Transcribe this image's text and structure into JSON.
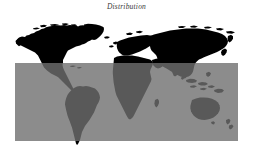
{
  "figure": {
    "title": "Distribution",
    "background_color": "#ffffff",
    "width": 253,
    "height": 157
  },
  "overlay": {
    "name": "distribution-highlight-rectangle",
    "color": "#6f6f6f",
    "opacity": 0.8,
    "x": 15,
    "y": 63,
    "width": 223,
    "height": 78
  },
  "map": {
    "name": "world-map-silhouette",
    "land_color": "#000000",
    "ocean_color": "#ffffff",
    "projection": "equirectangular",
    "regions": [
      "north-america",
      "greenland",
      "south-america",
      "europe",
      "africa",
      "asia",
      "australia",
      "new-zealand",
      "indonesia",
      "madagascar",
      "japan",
      "british-isles"
    ]
  },
  "chart_data": {
    "type": "heatmap",
    "title": "Distribution",
    "xlabel": "",
    "ylabel": "",
    "legend": "none",
    "grid": false,
    "categories": [
      "north-america",
      "greenland",
      "south-america",
      "europe",
      "africa",
      "asia",
      "australia",
      "new-zealand"
    ],
    "values": [
      1,
      1,
      1,
      1,
      1,
      1,
      1,
      1
    ],
    "annotations": [
      {
        "label": "distribution-region",
        "shape": "rectangle",
        "x": 15,
        "y": 63,
        "width": 223,
        "height": 78,
        "color": "#6f6f6f",
        "opacity": 0.8
      }
    ]
  }
}
